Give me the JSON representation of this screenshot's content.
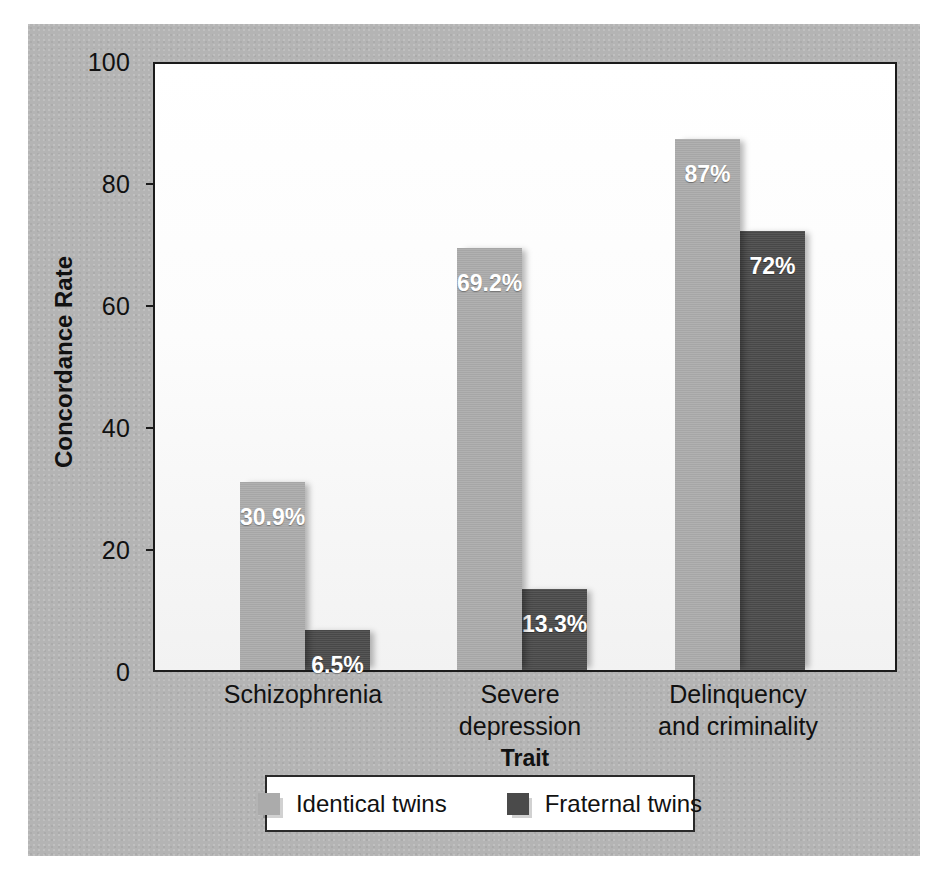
{
  "chart_data": {
    "type": "bar",
    "title": "",
    "xlabel": "Trait",
    "ylabel": "Concordance Rate",
    "ylim": [
      0,
      100
    ],
    "yticks": [
      0,
      20,
      40,
      60,
      80,
      100
    ],
    "grid": false,
    "legend_position": "bottom",
    "categories": [
      "Schizophrenia",
      "Severe depression",
      "Delinquency and criminality"
    ],
    "category_lines": [
      [
        "Schizophrenia"
      ],
      [
        "Severe",
        "depression"
      ],
      [
        "Delinquency",
        "and criminality"
      ]
    ],
    "series": [
      {
        "name": "Identical twins",
        "color": "#ababab",
        "values": [
          30.9,
          69.2,
          87
        ],
        "labels": [
          "30.9%",
          "69.2%",
          "87%"
        ]
      },
      {
        "name": "Fraternal twins",
        "color": "#4a4a4a",
        "values": [
          6.5,
          13.3,
          72
        ],
        "labels": [
          "6.5%",
          "13.3%",
          "72%"
        ]
      }
    ]
  },
  "axes": {
    "y_tick_labels": [
      "100",
      "80",
      "60",
      "40",
      "20",
      "0"
    ],
    "y_title": "Concordance Rate",
    "x_title": "Trait"
  },
  "legend": {
    "items": [
      {
        "label": "Identical twins",
        "color": "#ababab"
      },
      {
        "label": "Fraternal twins",
        "color": "#4a4a4a"
      }
    ]
  },
  "colors": {
    "panel_background": "#b4b4b4",
    "plot_background": "#ffffff",
    "axis_line": "#1b1b1b",
    "identical_twins": "#ababab",
    "fraternal_twins": "#4a4a4a",
    "value_label_text": "#ffffff"
  }
}
